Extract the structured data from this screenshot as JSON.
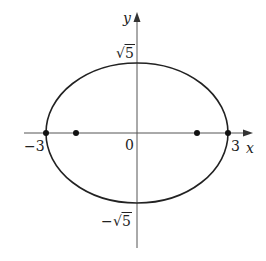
{
  "diagram": {
    "type": "ellipse-graph",
    "equation_semantics": "x^2/9 + y^2/5 = 1",
    "colors": {
      "background": "#ffffff",
      "curve": "#222222",
      "axis": "#444444",
      "text": "#222222"
    },
    "axes": {
      "x_label": "x",
      "y_label": "y"
    },
    "labels": {
      "origin": "0",
      "x_neg": "−3",
      "x_pos": "3",
      "y_pos_radical": "√",
      "y_pos_value": "5",
      "y_neg_sign": "−",
      "y_neg_radical": "√",
      "y_neg_value": "5"
    },
    "ellipse": {
      "semi_major_x": 3,
      "semi_minor_y": "√5"
    },
    "points": [
      {
        "name": "vertex-left",
        "x": -3,
        "y": 0
      },
      {
        "name": "focus-left",
        "x": -2,
        "y": 0
      },
      {
        "name": "focus-right",
        "x": 2,
        "y": 0
      },
      {
        "name": "vertex-right",
        "x": 3,
        "y": 0
      }
    ]
  }
}
